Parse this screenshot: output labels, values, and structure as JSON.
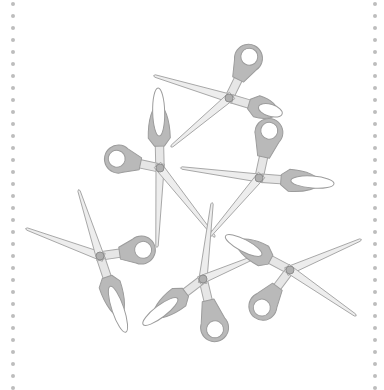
{
  "illustration": {
    "title": "Scattered scissors",
    "background": "#ffffff",
    "colors": {
      "blade_fill": "#ededed",
      "blade_stroke": "#a8a8a8",
      "handle_fill": "#b9b9b9",
      "handle_stroke": "#9c9c9c",
      "pivot_fill": "#b0b0b0",
      "border_dot": "#bdbdbd"
    },
    "border": {
      "style": "dotted",
      "left_x": 13,
      "right_x": 375,
      "dot_spacing": 12
    },
    "scissors": [
      {
        "id": "A",
        "pivot": [
          229,
          98
        ],
        "blades": [
          [
            155,
            76
          ],
          [
            172,
            146
          ]
        ],
        "handles": [
          {
            "type": "round",
            "end": [
              255,
              45
            ]
          },
          {
            "type": "oval",
            "end": [
              286,
              115
            ]
          }
        ]
      },
      {
        "id": "B",
        "pivot": [
          160,
          168
        ],
        "blades": [
          [
            157,
            246
          ],
          [
            214,
            236
          ]
        ],
        "handles": [
          {
            "type": "oval",
            "end": [
              158,
              84
            ]
          },
          {
            "type": "round",
            "end": [
              104,
              156
            ]
          }
        ]
      },
      {
        "id": "C",
        "pivot": [
          259,
          178
        ],
        "blades": [
          [
            182,
            168
          ],
          [
            208,
            238
          ]
        ],
        "handles": [
          {
            "type": "round",
            "end": [
              272,
              118
            ]
          },
          {
            "type": "oval",
            "end": [
              338,
              184
            ]
          }
        ]
      },
      {
        "id": "D",
        "pivot": [
          100,
          256
        ],
        "blades": [
          [
            27,
            229
          ],
          [
            79,
            191
          ]
        ],
        "handles": [
          {
            "type": "round",
            "end": [
              156,
              248
            ]
          },
          {
            "type": "oval",
            "end": [
              127,
              336
            ]
          }
        ]
      },
      {
        "id": "E",
        "pivot": [
          203,
          279
        ],
        "blades": [
          [
            212,
            204
          ],
          [
            262,
            254
          ]
        ],
        "handles": [
          {
            "type": "round",
            "end": [
              218,
              342
            ]
          },
          {
            "type": "oval",
            "end": [
              140,
              327
            ]
          }
        ]
      },
      {
        "id": "F",
        "pivot": [
          290,
          270
        ],
        "blades": [
          [
            360,
            240
          ],
          [
            355,
            315
          ]
        ],
        "handles": [
          {
            "type": "oval",
            "end": [
              222,
              234
            ]
          },
          {
            "type": "round",
            "end": [
              254,
              318
            ]
          }
        ]
      }
    ]
  }
}
